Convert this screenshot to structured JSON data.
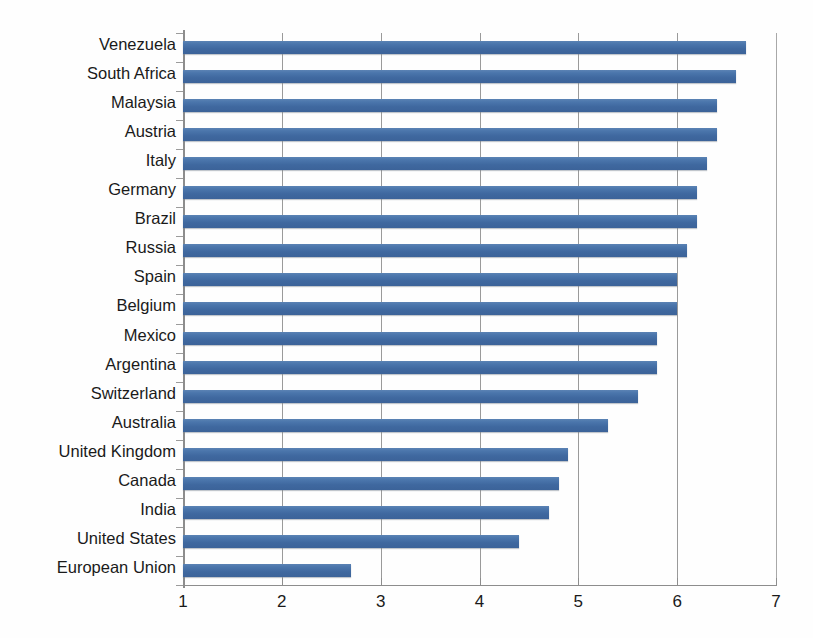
{
  "chart_data": {
    "type": "bar",
    "orientation": "horizontal",
    "title": "",
    "subtitle": "",
    "xlabel": "",
    "ylabel": "",
    "xlim": [
      1,
      7
    ],
    "ylim": null,
    "grid": true,
    "legend": false,
    "legend_position": "none",
    "xticks": [
      "1",
      "2",
      "3",
      "4",
      "5",
      "6",
      "7"
    ],
    "xtick_values": [
      1,
      2,
      3,
      4,
      5,
      6,
      7
    ],
    "bar_color": "#4472a8",
    "categories": [
      "Venezuela",
      "South Africa",
      "Malaysia",
      "Austria",
      "Italy",
      "Germany",
      "Brazil",
      "Russia",
      "Spain",
      "Belgium",
      "Mexico",
      "Argentina",
      "Switzerland",
      "Australia",
      "United Kingdom",
      "Canada",
      "India",
      "United  States",
      "European Union"
    ],
    "values": [
      6.7,
      6.6,
      6.4,
      6.4,
      6.3,
      6.2,
      6.2,
      6.1,
      6.0,
      6.0,
      5.8,
      5.8,
      5.6,
      5.3,
      4.9,
      4.8,
      4.7,
      4.4,
      2.7
    ],
    "series": [
      {
        "name": "",
        "values": [
          6.7,
          6.6,
          6.4,
          6.4,
          6.3,
          6.2,
          6.2,
          6.1,
          6.0,
          6.0,
          5.8,
          5.8,
          5.6,
          5.3,
          4.9,
          4.8,
          4.7,
          4.4,
          2.7
        ]
      }
    ]
  }
}
